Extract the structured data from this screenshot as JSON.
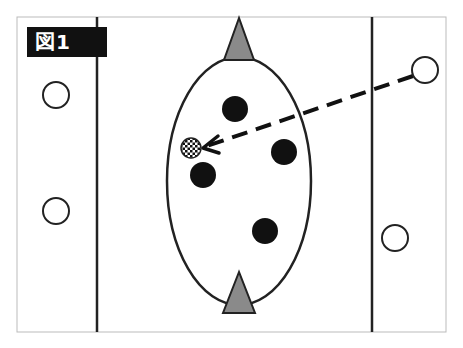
{
  "figure": {
    "label": "図1",
    "colors": {
      "line": "#222222",
      "frame": "#bbbbbb",
      "marker_fill": "#8a8a8a",
      "player_dark": "#111111",
      "label_bg": "#111111"
    },
    "frame": {
      "x": 17,
      "y": 17,
      "w": 429,
      "h": 315
    },
    "vertical_lines_x": [
      97,
      372
    ],
    "ellipse": {
      "cx": 239,
      "cy": 181,
      "rx": 72,
      "ry": 124
    },
    "triangles": [
      {
        "name": "top-marker",
        "apex": [
          239,
          18
        ],
        "base_y": 60,
        "half_w": 15
      },
      {
        "name": "bottom-marker",
        "apex": [
          239,
          272
        ],
        "base_y": 313,
        "half_w": 15
      }
    ],
    "open_circles": [
      {
        "cx": 56,
        "cy": 95,
        "r": 13
      },
      {
        "cx": 56,
        "cy": 211,
        "r": 13
      },
      {
        "cx": 395,
        "cy": 238,
        "r": 13
      },
      {
        "cx": 425,
        "cy": 70,
        "r": 13
      }
    ],
    "filled_circles": [
      {
        "cx": 235,
        "cy": 109,
        "r": 13
      },
      {
        "cx": 284,
        "cy": 152,
        "r": 13
      },
      {
        "cx": 203,
        "cy": 175,
        "r": 13
      },
      {
        "cx": 265,
        "cy": 231,
        "r": 13
      }
    ],
    "ball": {
      "cx": 191,
      "cy": 148,
      "r": 10
    },
    "pass_arrow": {
      "from": [
        413,
        76
      ],
      "to": [
        205,
        148
      ]
    }
  }
}
